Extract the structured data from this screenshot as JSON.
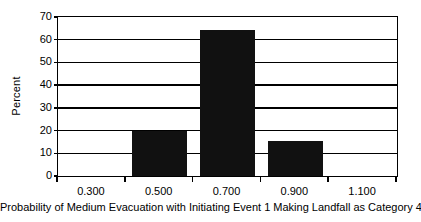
{
  "chart_data": {
    "type": "bar",
    "title": "",
    "subtitle": "",
    "xlabel": "Probability of Medium Evacuation with Initiating Event 1 Making Landfall as Category 4",
    "ylabel": "Percent",
    "categories": [
      "0.300",
      "0.500",
      "0.700",
      "0.900",
      "1.100"
    ],
    "x": [
      0.3,
      0.5,
      0.7,
      0.9,
      1.1
    ],
    "values": [
      0,
      20,
      64.5,
      15.3,
      0
    ],
    "xlim": [
      0.2,
      1.2
    ],
    "ylim": [
      0,
      70
    ],
    "y_ticks": [
      0,
      10,
      20,
      30,
      40,
      50,
      60,
      70
    ],
    "y_tick_labels": [
      "0",
      "10",
      "20",
      "30",
      "40",
      "50",
      "60",
      "70"
    ],
    "x_ticks": [
      0.3,
      0.5,
      0.7,
      0.9,
      1.1
    ],
    "x_tick_labels": [
      "0.300",
      "0.500",
      "0.700",
      "0.900",
      "1.100"
    ],
    "x_minor_ticks": [
      0.2,
      0.4,
      0.6,
      0.8,
      1.0,
      1.2
    ],
    "grid": "horizontal",
    "legend": null,
    "bar_color": "#111111",
    "axis_color": "#000000",
    "background_color": "#ffffff",
    "bars": [
      {
        "category": "0.300",
        "value": 0
      },
      {
        "category": "0.500",
        "value": 20
      },
      {
        "category": "0.700",
        "value": 64.5
      },
      {
        "category": "0.900",
        "value": 15.3
      },
      {
        "category": "1.100",
        "value": 0
      }
    ]
  }
}
